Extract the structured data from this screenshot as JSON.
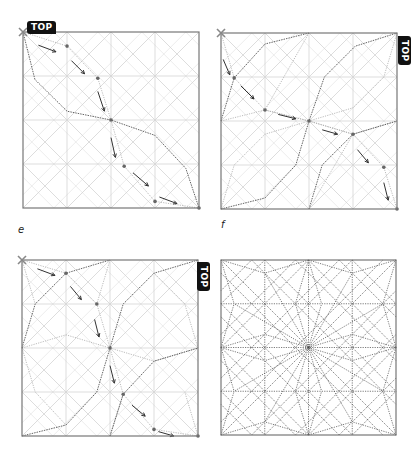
{
  "colors": {
    "frame": "#777777",
    "grid": "#d4d4d4",
    "crease_light": "#aaaaaa",
    "crease_dark": "#555555",
    "dot": "#666666",
    "arrow": "#333333",
    "tag_bg": "#111111",
    "tag_text": "#ffffff",
    "corner_x": "#888888"
  },
  "labels": {
    "e": "e",
    "f": "f"
  },
  "tag_text": "TOP",
  "panels": [
    {
      "id": "panel-d",
      "left": 23,
      "top": 32,
      "size": 176,
      "tag": {
        "text": "TOP",
        "orient": "horizontal",
        "x": 27,
        "y": 21
      },
      "corner_x": [
        0,
        0
      ],
      "dots": [
        [
          1.0,
          0.32
        ],
        [
          1.7,
          1.05
        ],
        [
          2,
          2
        ],
        [
          2.3,
          3.05
        ],
        [
          3.0,
          3.85
        ],
        [
          4,
          4
        ]
      ],
      "dark_paths": [
        [
          [
            0,
            0
          ],
          [
            0.27,
            1.08
          ],
          [
            1.0,
            1.8
          ],
          [
            2,
            2
          ],
          [
            3,
            2.35
          ],
          [
            3.7,
            3.1
          ],
          [
            4,
            4
          ]
        ]
      ],
      "light_paths": [
        [
          [
            0,
            0
          ],
          [
            1.0,
            0.32
          ],
          [
            1.7,
            1.05
          ],
          [
            2,
            2
          ],
          [
            2.3,
            3.05
          ],
          [
            3.0,
            3.85
          ],
          [
            4,
            4
          ]
        ]
      ],
      "arrows": [
        [
          [
            0.35,
            0.3
          ],
          [
            0.75,
            0.45
          ]
        ],
        [
          [
            1.1,
            0.65
          ],
          [
            1.4,
            0.95
          ]
        ],
        [
          [
            1.7,
            1.35
          ],
          [
            1.85,
            1.8
          ]
        ],
        [
          [
            2.0,
            2.4
          ],
          [
            2.1,
            2.85
          ]
        ],
        [
          [
            2.5,
            3.2
          ],
          [
            2.85,
            3.5
          ]
        ],
        [
          [
            3.1,
            3.75
          ],
          [
            3.5,
            3.9
          ]
        ]
      ]
    },
    {
      "id": "panel-e-top-right",
      "left": 221,
      "top": 33,
      "size": 176,
      "tag": {
        "text": "TOP",
        "orient": "vertical",
        "x": 398,
        "y": 36
      },
      "corner_x": [
        0,
        0
      ],
      "dots": [
        [
          0.3,
          1.02
        ],
        [
          1.0,
          1.75
        ],
        [
          2,
          2
        ],
        [
          3.0,
          2.3
        ],
        [
          3.7,
          3.05
        ],
        [
          4,
          4
        ]
      ],
      "dark_paths": [
        [
          [
            0,
            2
          ],
          [
            0.3,
            1.02
          ],
          [
            1.0,
            0.25
          ],
          [
            2,
            0
          ]
        ],
        [
          [
            0,
            4
          ],
          [
            1.0,
            3.75
          ],
          [
            1.7,
            3.0
          ],
          [
            2,
            2
          ],
          [
            2.35,
            1.0
          ],
          [
            3.05,
            0.3
          ],
          [
            4,
            0
          ]
        ],
        [
          [
            2,
            4
          ],
          [
            2.3,
            3.0
          ],
          [
            3.0,
            2.3
          ],
          [
            4,
            2
          ]
        ]
      ],
      "light_paths": [
        [
          [
            0,
            0
          ],
          [
            0.3,
            1.02
          ],
          [
            1.0,
            1.75
          ],
          [
            2,
            2
          ],
          [
            3.0,
            2.3
          ],
          [
            3.7,
            3.05
          ],
          [
            4,
            4
          ]
        ],
        [
          [
            0,
            2
          ],
          [
            1.0,
            1.75
          ],
          [
            2,
            2
          ]
        ],
        [
          [
            2,
            2
          ],
          [
            3.0,
            2.3
          ],
          [
            4,
            2
          ]
        ],
        [
          [
            0,
            4
          ],
          [
            0.3,
            3.0
          ],
          [
            1.0,
            2.3
          ],
          [
            2,
            2
          ]
        ],
        [
          [
            4,
            0
          ],
          [
            3.7,
            1.0
          ],
          [
            3.0,
            1.7
          ],
          [
            2,
            2
          ]
        ],
        [
          [
            2,
            0
          ],
          [
            1.0,
            1.75
          ]
        ],
        [
          [
            2,
            4
          ],
          [
            3.0,
            2.3
          ]
        ]
      ],
      "arrows": [
        [
          [
            0.05,
            0.6
          ],
          [
            0.2,
            0.95
          ]
        ],
        [
          [
            0.45,
            1.2
          ],
          [
            0.75,
            1.5
          ]
        ],
        [
          [
            1.3,
            1.85
          ],
          [
            1.7,
            1.95
          ]
        ],
        [
          [
            2.3,
            2.2
          ],
          [
            2.65,
            2.3
          ]
        ],
        [
          [
            3.1,
            2.65
          ],
          [
            3.35,
            2.95
          ]
        ],
        [
          [
            3.7,
            3.4
          ],
          [
            3.8,
            3.8
          ]
        ]
      ]
    },
    {
      "id": "panel-e",
      "left": 22,
      "top": 260,
      "size": 176,
      "tag": {
        "text": "TOP",
        "orient": "vertical",
        "x": 197,
        "y": 262
      },
      "corner_x": [
        0,
        0
      ],
      "dots": [
        [
          1.0,
          0.3
        ],
        [
          1.7,
          1.0
        ],
        [
          2,
          2
        ],
        [
          2.3,
          3.05
        ],
        [
          3.0,
          3.85
        ],
        [
          4,
          4
        ]
      ],
      "dark_paths": [
        [
          [
            0,
            2
          ],
          [
            0.3,
            1.0
          ],
          [
            1.0,
            0.3
          ],
          [
            2,
            0
          ]
        ],
        [
          [
            0,
            4
          ],
          [
            1.0,
            3.75
          ],
          [
            1.7,
            3.0
          ],
          [
            2,
            2
          ],
          [
            2.3,
            1.0
          ],
          [
            3.0,
            0.3
          ],
          [
            4,
            0
          ]
        ],
        [
          [
            2,
            4
          ],
          [
            2.3,
            3.05
          ],
          [
            3.0,
            2.3
          ],
          [
            4,
            2
          ]
        ]
      ],
      "light_paths": [
        [
          [
            0,
            0
          ],
          [
            1.0,
            0.3
          ],
          [
            1.7,
            1.0
          ],
          [
            2,
            2
          ],
          [
            2.3,
            3.05
          ],
          [
            3.0,
            3.85
          ],
          [
            4,
            4
          ]
        ],
        [
          [
            0,
            2
          ],
          [
            1.0,
            1.7
          ],
          [
            2,
            2
          ]
        ],
        [
          [
            2,
            2
          ],
          [
            3.0,
            2.3
          ],
          [
            4,
            2
          ]
        ],
        [
          [
            0,
            0
          ],
          [
            0.3,
            1.0
          ]
        ],
        [
          [
            2,
            0
          ],
          [
            1.7,
            1.0
          ]
        ],
        [
          [
            2,
            4
          ],
          [
            2.3,
            3.05
          ]
        ],
        [
          [
            4,
            4
          ],
          [
            3.7,
            3.0
          ]
        ],
        [
          [
            0,
            2
          ],
          [
            0.3,
            3.0
          ],
          [
            1.0,
            3.75
          ]
        ],
        [
          [
            4,
            2
          ],
          [
            3.7,
            1.0
          ],
          [
            3.0,
            0.3
          ]
        ]
      ],
      "arrows": [
        [
          [
            0.35,
            0.2
          ],
          [
            0.75,
            0.35
          ]
        ],
        [
          [
            1.1,
            0.6
          ],
          [
            1.35,
            0.9
          ]
        ],
        [
          [
            1.65,
            1.35
          ],
          [
            1.75,
            1.75
          ]
        ],
        [
          [
            2.0,
            2.4
          ],
          [
            2.1,
            2.8
          ]
        ],
        [
          [
            2.5,
            3.3
          ],
          [
            2.8,
            3.55
          ]
        ],
        [
          [
            3.1,
            3.9
          ],
          [
            3.45,
            4.0
          ]
        ]
      ]
    },
    {
      "id": "panel-f",
      "left": 221,
      "top": 260,
      "size": 175,
      "tag": null,
      "corner_x": null,
      "dots": [],
      "dark_paths": [],
      "light_paths": [],
      "arrows": [],
      "full_crease": true
    }
  ],
  "label_positions": {
    "e": {
      "x": 18,
      "y": 224
    },
    "f": {
      "x": 221,
      "y": 219
    }
  }
}
